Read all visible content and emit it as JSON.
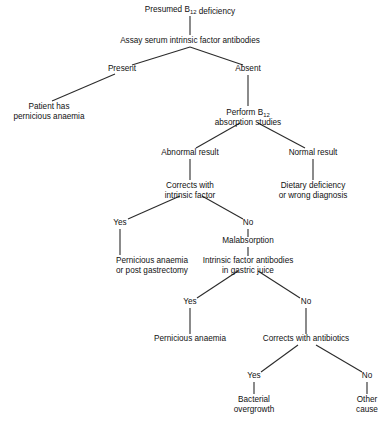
{
  "diagram": {
    "title": "Presumed B12 deficiency",
    "type": "decision-tree-flowchart",
    "background_color": "#ffffff",
    "line_color": "#2b2b2b",
    "text_color": "#111111",
    "nodes": [
      {
        "id": "presumed",
        "lines": [
          "Presumed B|12| deficiency"
        ],
        "x": 190,
        "y": 12,
        "align": "middle"
      },
      {
        "id": "assay",
        "lines": [
          "Assay serum intrinsic factor antibodies"
        ],
        "x": 190,
        "y": 43,
        "align": "middle"
      },
      {
        "id": "patient-has-pernicious",
        "lines": [
          "Patient has",
          "pernicious anaemia"
        ],
        "x": 49,
        "y": 109,
        "align": "middle"
      },
      {
        "id": "perform-absorption",
        "lines": [
          "Perform B|12|",
          "absorption studies"
        ],
        "x": 248,
        "y": 115,
        "align": "middle"
      },
      {
        "id": "corrects-intrinsic",
        "lines": [
          "Corrects with",
          "intrinsic factor"
        ],
        "x": 190,
        "y": 188,
        "align": "middle"
      },
      {
        "id": "dietary-deficiency",
        "lines": [
          "Dietary deficiency",
          "or wrong diagnosis"
        ],
        "x": 313,
        "y": 188,
        "align": "middle"
      },
      {
        "id": "malabsorption",
        "lines": [
          "Malabsorption"
        ],
        "x": 248,
        "y": 243,
        "align": "middle"
      },
      {
        "id": "pernicious-or-gastrectomy",
        "lines": [
          "Pernicious anaemia",
          "or post gastrectomy"
        ],
        "x": 152,
        "y": 263,
        "align": "middle"
      },
      {
        "id": "intrinsic-gastric-juice",
        "lines": [
          "Intrinsic factor antibodies",
          "in gastric juice"
        ],
        "x": 248,
        "y": 263,
        "align": "middle"
      },
      {
        "id": "pernicious-anaemia-final",
        "lines": [
          "Pernicious anaemia"
        ],
        "x": 190,
        "y": 341,
        "align": "middle"
      },
      {
        "id": "corrects-antibiotics",
        "lines": [
          "Corrects with antibiotics"
        ],
        "x": 306,
        "y": 341,
        "align": "middle"
      },
      {
        "id": "bacterial-overgrowth",
        "lines": [
          "Bacterial",
          "overgrowth"
        ],
        "x": 254,
        "y": 402,
        "align": "middle"
      },
      {
        "id": "other-cause",
        "lines": [
          "Other",
          "cause"
        ],
        "x": 367,
        "y": 402,
        "align": "middle"
      }
    ],
    "edge_labels": [
      {
        "id": "present",
        "text": "Present",
        "x": 122,
        "y": 71
      },
      {
        "id": "absent",
        "text": "Absent",
        "x": 248,
        "y": 71
      },
      {
        "id": "abnormal-result",
        "text": "Abnormal result",
        "x": 190,
        "y": 155
      },
      {
        "id": "normal-result",
        "text": "Normal result",
        "x": 313,
        "y": 155
      },
      {
        "id": "yes-intrinsic",
        "text": "Yes",
        "x": 120,
        "y": 225
      },
      {
        "id": "no-intrinsic",
        "text": "No",
        "x": 248,
        "y": 225
      },
      {
        "id": "yes-gastric",
        "text": "Yes",
        "x": 190,
        "y": 304
      },
      {
        "id": "no-gastric",
        "text": "No",
        "x": 306,
        "y": 304
      },
      {
        "id": "yes-antibiotics",
        "text": "Yes",
        "x": 254,
        "y": 378
      },
      {
        "id": "no-antibiotics",
        "text": "No",
        "x": 367,
        "y": 378
      }
    ],
    "connectors": [
      {
        "id": "presumed-to-assay",
        "x1": 190,
        "y1": 16,
        "x2": 190,
        "y2": 35
      },
      {
        "id": "assay-to-present",
        "x1": 190,
        "y1": 47,
        "x2": 132,
        "y2": 65
      },
      {
        "id": "assay-to-absent",
        "x1": 190,
        "y1": 47,
        "x2": 243,
        "y2": 65
      },
      {
        "id": "present-to-patient",
        "x1": 115,
        "y1": 74,
        "x2": 52,
        "y2": 101
      },
      {
        "id": "absent-to-perform",
        "x1": 248,
        "y1": 75,
        "x2": 248,
        "y2": 106
      },
      {
        "id": "perform-to-abnormal",
        "x1": 240,
        "y1": 123,
        "x2": 196,
        "y2": 148
      },
      {
        "id": "perform-to-normal",
        "x1": 258,
        "y1": 123,
        "x2": 305,
        "y2": 148
      },
      {
        "id": "abnormal-to-corrects",
        "x1": 190,
        "y1": 159,
        "x2": 190,
        "y2": 180
      },
      {
        "id": "normal-to-dietary",
        "x1": 313,
        "y1": 159,
        "x2": 313,
        "y2": 180
      },
      {
        "id": "corrects-to-yes",
        "x1": 180,
        "y1": 196,
        "x2": 128,
        "y2": 219
      },
      {
        "id": "corrects-to-no",
        "x1": 202,
        "y1": 196,
        "x2": 243,
        "y2": 219
      },
      {
        "id": "yes-to-pernicious-gastrectomy",
        "x1": 120,
        "y1": 229,
        "x2": 120,
        "y2": 255
      },
      {
        "id": "no-to-malabsorption",
        "x1": 248,
        "y1": 229,
        "x2": 248,
        "y2": 237
      },
      {
        "id": "malabsorption-to-intrinsic",
        "x1": 248,
        "y1": 247,
        "x2": 248,
        "y2": 256
      },
      {
        "id": "intrinsic-to-yes",
        "x1": 238,
        "y1": 271,
        "x2": 197,
        "y2": 298
      },
      {
        "id": "intrinsic-to-no",
        "x1": 258,
        "y1": 271,
        "x2": 300,
        "y2": 298
      },
      {
        "id": "yes-to-pernicious-final",
        "x1": 190,
        "y1": 308,
        "x2": 190,
        "y2": 334
      },
      {
        "id": "no-to-corrects-antibiotics",
        "x1": 306,
        "y1": 308,
        "x2": 306,
        "y2": 334
      },
      {
        "id": "antibiotics-to-yes",
        "x1": 298,
        "y1": 345,
        "x2": 261,
        "y2": 372
      },
      {
        "id": "antibiotics-to-no",
        "x1": 316,
        "y1": 345,
        "x2": 362,
        "y2": 372
      },
      {
        "id": "yes-to-bacterial",
        "x1": 254,
        "y1": 382,
        "x2": 254,
        "y2": 394
      },
      {
        "id": "no-to-other",
        "x1": 367,
        "y1": 382,
        "x2": 367,
        "y2": 394
      }
    ]
  }
}
